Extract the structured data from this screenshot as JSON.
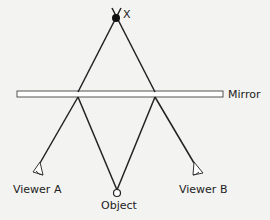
{
  "diagram": {
    "type": "mirror-reflection-ray-diagram",
    "labels": {
      "virtual_image": "X",
      "mirror": "Mirror",
      "viewer_a": "Viewer A",
      "viewer_b": "Viewer B",
      "object": "Object"
    },
    "colors": {
      "background": "#f3f3f1",
      "line": "#222222",
      "mirror_fill": "#ffffff"
    },
    "nodes": [
      {
        "id": "X",
        "label": "X",
        "kind": "virtual-image-point"
      },
      {
        "id": "object",
        "label": "Object",
        "kind": "object-circle"
      },
      {
        "id": "viewer_a",
        "label": "Viewer A",
        "kind": "eye"
      },
      {
        "id": "viewer_b",
        "label": "Viewer B",
        "kind": "eye"
      },
      {
        "id": "mirror",
        "label": "Mirror",
        "kind": "plane-mirror"
      }
    ],
    "edges": [
      {
        "from": "object",
        "to": "mirror",
        "note": "ray to left reflection point"
      },
      {
        "from": "mirror",
        "to": "viewer_a",
        "note": "reflected ray"
      },
      {
        "from": "object",
        "to": "mirror",
        "note": "ray to right reflection point"
      },
      {
        "from": "mirror",
        "to": "viewer_b",
        "note": "reflected ray"
      },
      {
        "from": "mirror",
        "to": "X",
        "note": "extended sight lines meet at image X"
      }
    ]
  }
}
